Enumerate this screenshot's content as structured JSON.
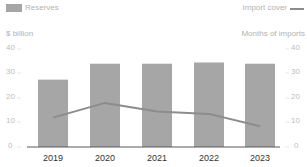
{
  "legend": {
    "bars_label": "Reserves",
    "line_label": "Import cover"
  },
  "axes": {
    "left_unit": "$ billion",
    "right_unit": "Months of imports",
    "left_ticks": [
      "40",
      "30",
      "20",
      "10",
      "0"
    ],
    "right_ticks": [
      "40",
      "30",
      "20",
      "10",
      "0"
    ]
  },
  "x_labels": [
    "2019",
    "2020",
    "2021",
    "2022",
    "2023"
  ],
  "colors": {
    "bar": "#a6a6a6",
    "line": "#8c8c8c",
    "axis": "#595959",
    "tick_text": "#bdbdbd",
    "x_text": "#333333"
  },
  "chart_data": {
    "type": "bar+line",
    "title": "",
    "categories": [
      "2019",
      "2020",
      "2021",
      "2022",
      "2023"
    ],
    "series": [
      {
        "name": "Reserves",
        "type": "bar",
        "axis": "left",
        "unit": "$ billion",
        "values": [
          27.5,
          34,
          34,
          34.5,
          34
        ]
      },
      {
        "name": "Import cover",
        "type": "line",
        "axis": "right",
        "unit": "Months of imports",
        "values": [
          12,
          18,
          14.5,
          13.5,
          8.5
        ]
      }
    ],
    "xlabel": "",
    "ylabel_left": "$ billion",
    "ylabel_right": "Months of imports",
    "ylim_left": [
      0,
      40
    ],
    "ylim_right": [
      0,
      40
    ],
    "yticks": [
      0,
      10,
      20,
      30,
      40
    ],
    "grid": false,
    "legend_position": "top"
  }
}
